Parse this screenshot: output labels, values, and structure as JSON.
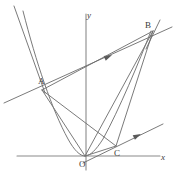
{
  "figure": {
    "width": 176,
    "height": 188,
    "background": "#ffffff",
    "stroke_color": "#6b6b6b",
    "curve_color": "#7a7a7a",
    "label_color": "#3a3a3a",
    "stroke_width": 0.9
  },
  "axes": {
    "x_label": "x",
    "y_label": "y",
    "x_label_pos": {
      "x": 161,
      "y": 153
    },
    "y_label_pos": {
      "x": 87,
      "y": 11
    },
    "x_axis": {
      "x1": 17,
      "y1": 156,
      "x2": 160,
      "y2": 156
    },
    "y_axis": {
      "x1": 86,
      "y1": 14,
      "x2": 86,
      "y2": 170
    }
  },
  "points": [
    {
      "name": "O",
      "label": "O",
      "x": 85,
      "y": 156,
      "label_x": 79,
      "label_y": 160,
      "role": "origin-vertex"
    },
    {
      "name": "A",
      "label": "A",
      "x": 42,
      "y": 90,
      "label_x": 38,
      "label_y": 77,
      "role": "left-branch-point"
    },
    {
      "name": "B",
      "label": "B",
      "x": 153,
      "y": 31,
      "label_x": 145,
      "label_y": 21,
      "role": "upper-right-point"
    },
    {
      "name": "C",
      "label": "C",
      "x": 116,
      "y": 146,
      "label_x": 114,
      "label_y": 149,
      "role": "lower-right-point"
    }
  ],
  "parabola": {
    "vertex": {
      "x": 85,
      "y": 156
    },
    "description": "upward-opening parabola with vertex at origin",
    "path": "M 23,11 C 36,62 52,110 68,139 C 74,150 80,156 85,156 C 90,156 96,150 103,139 C 119,110 139,62 151,31"
  },
  "segments": [
    {
      "name": "segment-A-O",
      "from": "A",
      "to": "O"
    },
    {
      "name": "segment-A-B",
      "from": "A",
      "to": "B"
    },
    {
      "name": "segment-A-C",
      "from": "A",
      "to": "C"
    },
    {
      "name": "segment-B-O",
      "from": "B",
      "to": "O"
    },
    {
      "name": "segment-B-C",
      "from": "B",
      "to": "C"
    },
    {
      "name": "segment-O-C",
      "from": "O",
      "to": "C"
    }
  ],
  "rays": [
    {
      "name": "ray-through-A-B",
      "x1": 4,
      "y1": 103,
      "x2": 172,
      "y2": 27,
      "arrow_at": {
        "x": 112,
        "y": 55
      },
      "arrow_angle": -24
    },
    {
      "name": "ray-through-O-C",
      "x1": 83,
      "y1": 163,
      "x2": 163,
      "y2": 124,
      "arrow_at": {
        "x": 141,
        "y": 134
      },
      "arrow_angle": -26
    }
  ],
  "extra_lines": [
    {
      "name": "line-steep-left-upper",
      "x1": 14,
      "y1": 6,
      "x2": 45,
      "y2": 93
    },
    {
      "name": "line-steep-at-B",
      "x1": 160,
      "y1": 20,
      "x2": 146,
      "y2": 49
    }
  ]
}
